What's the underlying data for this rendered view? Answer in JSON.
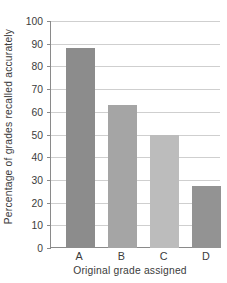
{
  "chart_data": {
    "type": "bar",
    "title": "",
    "subtitle": "",
    "xlabel": "Original grade assigned",
    "ylabel": "Percentage of grades recalled accurately",
    "categories": [
      "A",
      "B",
      "C",
      "D"
    ],
    "values": [
      88,
      63,
      50,
      27.5
    ],
    "series": [
      {
        "name": "Percentage of grades recalled accurately",
        "values": [
          88,
          63,
          50,
          27.5
        ]
      }
    ],
    "bar_colors": [
      "#8c8c8c",
      "#a5a5a5",
      "#bcbcbc",
      "#939393"
    ],
    "ylim": [
      0,
      100
    ],
    "yticks": [
      0,
      10,
      20,
      30,
      40,
      50,
      60,
      70,
      80,
      90,
      100
    ],
    "ytick_labels": [
      "0",
      "10",
      "20",
      "30",
      "40",
      "50",
      "60",
      "70",
      "80",
      "90",
      "100"
    ],
    "xtick_labels": [
      "A",
      "B",
      "C",
      "D"
    ],
    "grid": true,
    "grid_axis": "y",
    "grid_color": "#cfcfcf",
    "axis_color": "#8a8a8a",
    "text_color": "#3b3b3b",
    "background_color": "#ffffff",
    "legend": false,
    "legend_position": "none",
    "annotations": []
  }
}
